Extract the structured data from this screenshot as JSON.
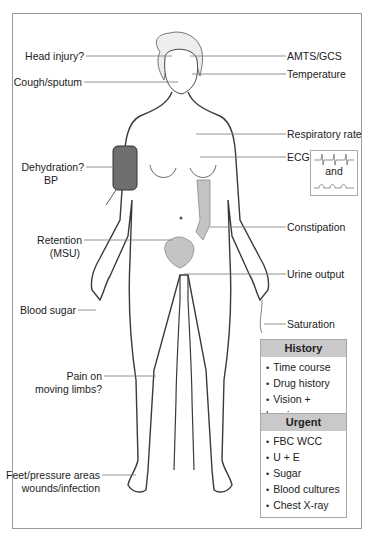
{
  "figure": {
    "left_labels": {
      "head_injury": "Head injury?",
      "cough": "Cough/sputum",
      "dehydration": "Dehydration?",
      "bp": "BP",
      "retention": "Retention",
      "msu": "(MSU)",
      "blood_sugar": "Blood sugar",
      "pain_1": "Pain on",
      "pain_2": "moving limbs?",
      "feet_1": "Feet/pressure areas",
      "feet_2": "wounds/infection"
    },
    "right_labels": {
      "amts": "AMTS/GCS",
      "temperature": "Temperature",
      "resp_rate": "Respiratory rate",
      "ecg": "ECG",
      "ecg_and": "and",
      "constipation": "Constipation",
      "urine": "Urine output",
      "saturation": "Saturation"
    },
    "history": {
      "title": "History",
      "items": [
        "Time course",
        "Drug history",
        "Vision + hearing"
      ]
    },
    "urgent": {
      "title": "Urgent",
      "items": [
        "FBC  WCC",
        "U + E",
        "Sugar",
        "Blood cultures",
        "Chest X-ray"
      ]
    },
    "colors": {
      "cuff": "#6e6e6e",
      "organ": "#c4c4c4",
      "outline": "#3a3a3a",
      "leader": "#777777",
      "box_header": "#c9c9c9"
    }
  }
}
